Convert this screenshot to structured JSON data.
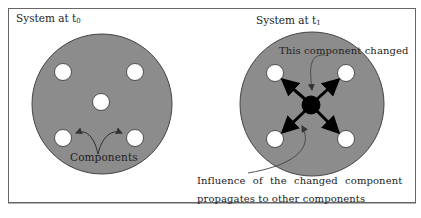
{
  "diagram": {
    "left_panel": {
      "title_prefix": "System at t",
      "title_subscript": "0",
      "components_label": "Components",
      "component_count": 5
    },
    "right_panel": {
      "title_prefix": "System at t",
      "title_subscript": "1",
      "changed_label": "This component changed",
      "influence_label_line1": "Influence of the changed component",
      "influence_label_line2": "propagates to other components",
      "component_count": 5
    },
    "colors": {
      "system_fill": "#8c8c8c",
      "component_fill": "#ffffff",
      "changed_component_fill": "#000000",
      "border": "#555555"
    }
  }
}
